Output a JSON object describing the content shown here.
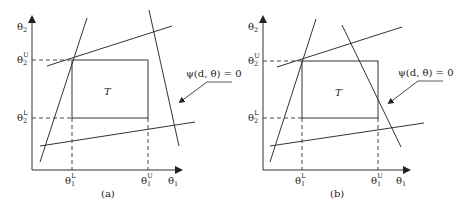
{
  "panels": [
    {
      "id": "a",
      "caption": "(a)",
      "region_label": "T",
      "annotation": "ψ(d, θ) = 0",
      "axis_labels": {
        "x": "θ1",
        "y": "θ2"
      },
      "ticks": {
        "x_lower": "θ1L",
        "x_upper": "θ1U",
        "y_lower": "θ2L",
        "y_upper": "θ2U"
      }
    },
    {
      "id": "b",
      "caption": "(b)",
      "region_label": "T",
      "annotation": "ψ(d, θ) = 0",
      "axis_labels": {
        "x": "θ1",
        "y": "θ2"
      },
      "ticks": {
        "x_lower": "θ1L",
        "x_upper": "θ1U",
        "y_lower": "θ2L",
        "y_upper": "θ2U"
      }
    }
  ],
  "text": {
    "theta": "θ",
    "sub1": "1",
    "sub2": "2",
    "supL": "L",
    "supU": "U",
    "T": "T",
    "psi_a": "ψ(d, θ) = 0",
    "psi_b": "ψ(d, θ) = 0",
    "cap_a": "(a)",
    "cap_b": "(b)"
  },
  "colors": {
    "stroke": "#333333",
    "text": "#222222"
  }
}
